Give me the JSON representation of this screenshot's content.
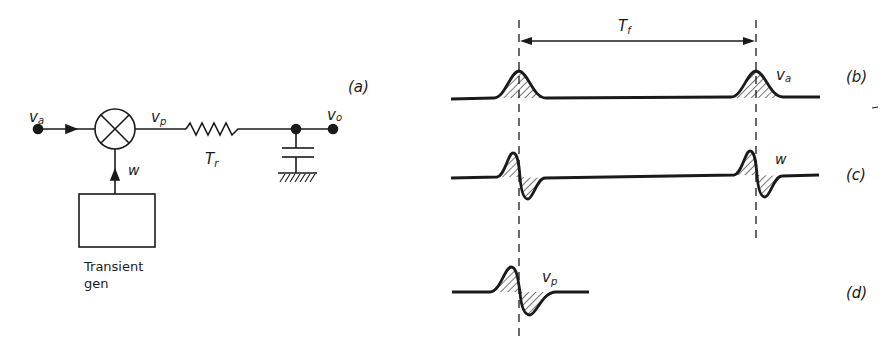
{
  "circuit": {
    "panel_label": "(a)",
    "input_label": "v",
    "input_sub": "a",
    "mixer_output_label": "v",
    "mixer_output_sub": "p",
    "control_label": "w",
    "resistor_label": "T",
    "resistor_sub": "r",
    "output_label": "v",
    "output_sub": "o",
    "generator_label_line1": "Transient",
    "generator_label_line2": "gen"
  },
  "waveforms": {
    "period_label": "T",
    "period_sub": "f",
    "b": {
      "panel_label": "(b)",
      "signal_label": "v",
      "signal_sub": "a"
    },
    "c": {
      "panel_label": "(c)",
      "signal_label": "w"
    },
    "d": {
      "panel_label": "(d)",
      "signal_label": "v",
      "signal_sub": "p"
    }
  },
  "colors": {
    "ink": "#1a1a1a",
    "paper": "#ffffff"
  }
}
